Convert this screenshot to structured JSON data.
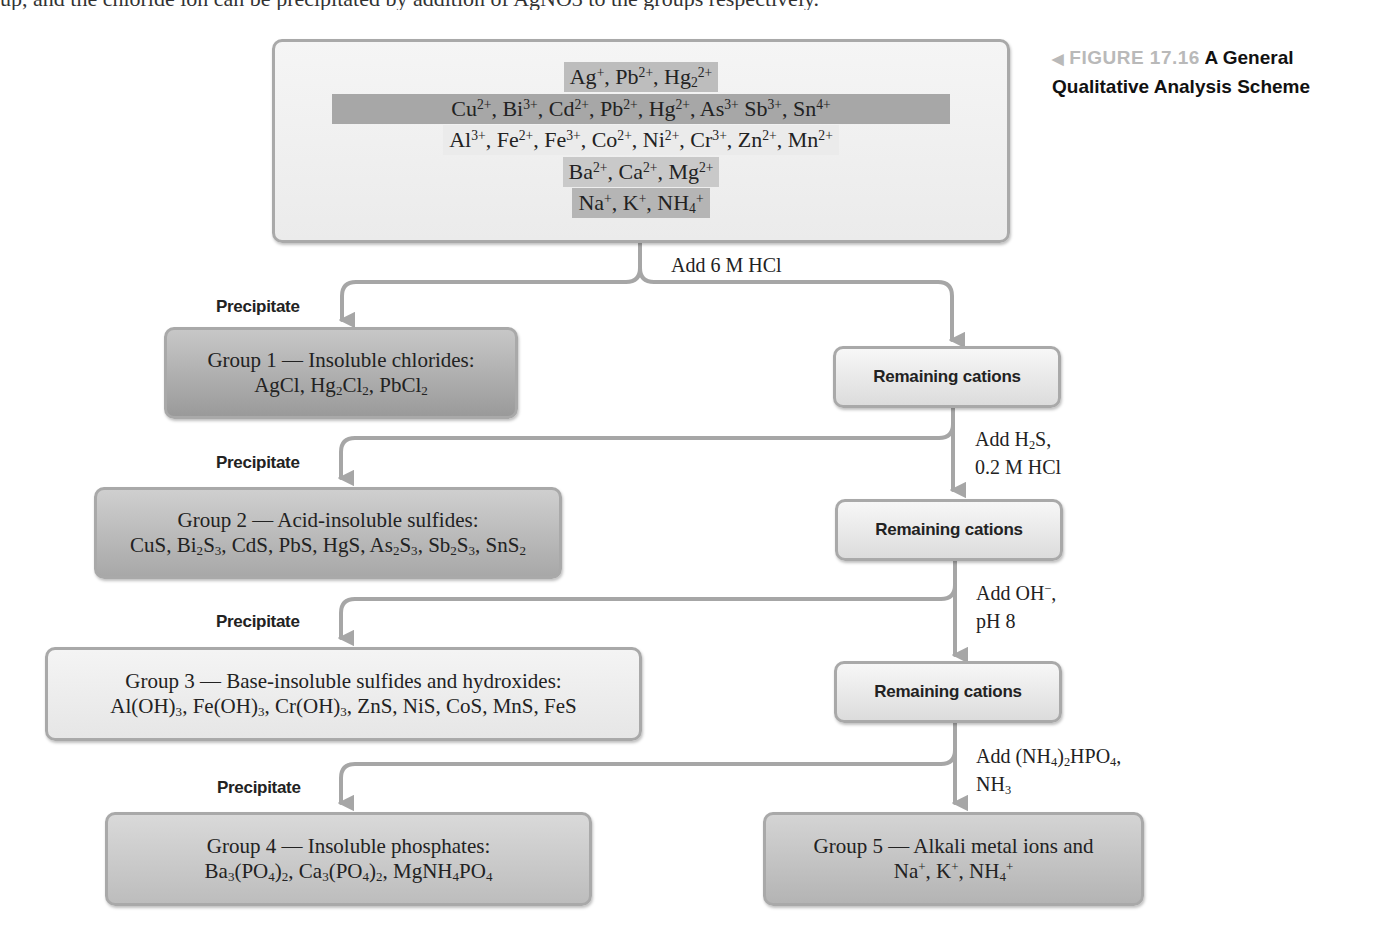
{
  "header_fragment": "up, and the chloride ion can be precipitated by addition of AgNO3 to the groups respectively.",
  "caption": {
    "figure_number": "FIGURE 17.16",
    "title": "A General Qualitative Analysis Scheme",
    "title_line1": "A General",
    "title_line2": "Qualitative Analysis Scheme",
    "marker_icon": "left-triangle"
  },
  "start_solution": {
    "rows": [
      "Ag+, Pb2+, Hg2 2+",
      "Cu2+, Bi3+, Cd2+, Pb2+, Hg2+, As3+ Sb3+, Sn4+",
      "Al3+, Fe2+, Fe3+, Co2+, Ni2+, Cr3+, Zn2+, Mn2+",
      "Ba2+, Ca2+, Mg2+",
      "Na+, K+, NH4+"
    ]
  },
  "steps": [
    {
      "reagent": "Add 6 M HCl",
      "precipitate_label": "Precipitate",
      "group_title": "Group 1 — Insoluble chlorides:",
      "group_compounds": "AgCl, Hg2Cl2, PbCl2",
      "remaining_label": "Remaining cations"
    },
    {
      "reagent_line1": "Add H2S,",
      "reagent_line2": "0.2 M HCl",
      "precipitate_label": "Precipitate",
      "group_title": "Group 2 — Acid-insoluble sulfides:",
      "group_compounds": "CuS, Bi2S3, CdS, PbS, HgS, As2S3, Sb2S3, SnS2",
      "remaining_label": "Remaining cations"
    },
    {
      "reagent_line1": "Add OH−,",
      "reagent_line2": "pH 8",
      "precipitate_label": "Precipitate",
      "group_title": "Group 3 — Base-insoluble sulfides and hydroxides:",
      "group_compounds": "Al(OH)3, Fe(OH)3, Cr(OH)3, ZnS, NiS, CoS, MnS, FeS",
      "remaining_label": "Remaining cations"
    },
    {
      "reagent_line1": "Add (NH4)2HPO4,",
      "reagent_line2": "NH3",
      "precipitate_label": "Precipitate",
      "group_title": "Group 4 — Insoluble phosphates:",
      "group_compounds": "Ba3(PO4)2, Ca3(PO4)2, MgNH4PO4"
    }
  ],
  "final_group": {
    "title": "Group 5 — Alkali metal ions and",
    "ions": "Na+, K+, NH4+"
  },
  "colors": {
    "arrow": "#a6a6a6",
    "box_border": "#a9a9a9",
    "caption_figure": "#b9b9b9",
    "caption_title": "#111111"
  }
}
